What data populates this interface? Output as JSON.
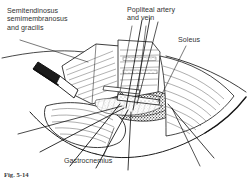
{
  "figure": {
    "kind": "medical-line-art-illustration",
    "background_color": "#ffffff",
    "ink_color": "#1a1a1a",
    "label_color": "#323232"
  },
  "labels": {
    "hamstrings": "Semitendinosus\nsemimembranosus\nand gracilis",
    "popliteal_vessels": "Popliteal artery\nand vein",
    "soleus": "Soleus",
    "gastrocnemius": "Gastrocnemius"
  },
  "caption": {
    "text": "Fig. 5-14"
  }
}
